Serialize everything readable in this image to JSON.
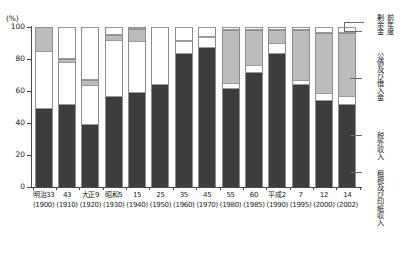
{
  "axis": {
    "unit_label": "(%)",
    "y_ticks": [
      "100",
      "80",
      "60",
      "40",
      "20",
      "0"
    ],
    "y_values": [
      100,
      80,
      60,
      40,
      20,
      0
    ]
  },
  "legend": {
    "items": [
      {
        "id": "surplus",
        "label": "前年度剰余金",
        "color": "#ffffff",
        "lines": [
          "前年度",
          "剰余金"
        ]
      },
      {
        "id": "bonds",
        "label": "公債及び借入金",
        "color": "#bcbcbc",
        "lines": [
          "公債及び借入金"
        ]
      },
      {
        "id": "nontax",
        "label": "税外収入",
        "color": "#ffffff",
        "lines": [
          "税外収入"
        ]
      },
      {
        "id": "tax",
        "label": "租税及び印紙収入",
        "color": "#3d3d3d",
        "lines": [
          "租税及び印紙収入"
        ]
      }
    ]
  },
  "chart_data": {
    "type": "bar",
    "title": "",
    "subtitle": "",
    "xlabel": "",
    "ylabel": "(%)",
    "ylim": [
      0,
      100
    ],
    "stacked": true,
    "normalized_percent": true,
    "grid": false,
    "legend_position": "right",
    "categories": [
      "明治33\n(1900)",
      "43\n(1910)",
      "大正9\n(1920)",
      "昭和5\n(1930)",
      "15\n(1940)",
      "25\n(1950)",
      "35\n(1960)",
      "45\n(1970)",
      "55\n(1980)",
      "60\n(1985)",
      "平成2\n(1990)",
      "7\n(1995)",
      "12\n(2000)",
      "14\n(2002)"
    ],
    "category_era": [
      "明治33",
      "43",
      "大正9",
      "昭和5",
      "15",
      "25",
      "35",
      "45",
      "55",
      "60",
      "平成2",
      "7",
      "12",
      "14"
    ],
    "category_year": [
      "(1900)",
      "(1910)",
      "(1920)",
      "(1930)",
      "(1940)",
      "(1950)",
      "(1960)",
      "(1970)",
      "(1980)",
      "(1985)",
      "(1990)",
      "(1995)",
      "(2000)",
      "(2002)"
    ],
    "series": [
      {
        "name": "租税及び印紙収入",
        "key": "tax",
        "color": "#3d3d3d",
        "values": [
          49,
          51,
          39,
          56,
          59,
          64,
          83,
          87,
          61,
          71,
          83,
          64,
          54,
          51
        ]
      },
      {
        "name": "税外収入",
        "key": "nontax",
        "color": "#ffffff",
        "values": [
          36,
          27,
          25,
          36,
          32,
          0,
          8,
          7,
          4,
          5,
          7,
          3,
          5,
          6
        ]
      },
      {
        "name": "公債及び借入金",
        "key": "bonds",
        "color": "#bcbcbc",
        "values": [
          15,
          2,
          3,
          3,
          8,
          0,
          0,
          0,
          33,
          22,
          8,
          31,
          37,
          39
        ]
      },
      {
        "name": "前年度剰余金",
        "key": "surplus",
        "color": "#ffffff",
        "values": [
          0,
          20,
          33,
          5,
          1,
          36,
          9,
          6,
          2,
          2,
          2,
          2,
          4,
          4
        ]
      }
    ]
  }
}
